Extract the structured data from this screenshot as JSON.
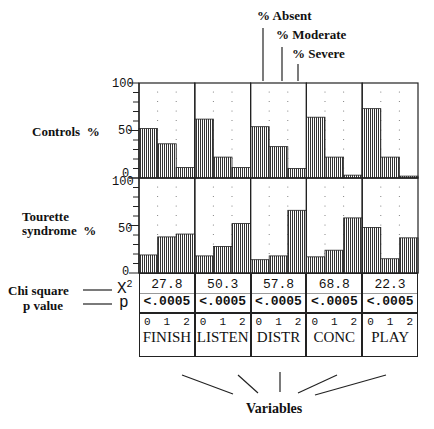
{
  "legend": {
    "absent": "% Absent",
    "moderate": "% Moderate",
    "severe": "% Severe"
  },
  "row_labels": {
    "controls": "Controls  %",
    "tourette_line1": "Tourette",
    "tourette_line2": "syndrome  %",
    "chi_square": "Chi square",
    "p_value": "p value",
    "x2_symbol": "X",
    "x2_sup": "2",
    "p_symbol": "p"
  },
  "axis": {
    "ticks_top": [
      "100",
      "50",
      "0"
    ],
    "ticks_bottom": [
      "100",
      "50",
      "0"
    ]
  },
  "footer": {
    "variables_label": "Variables"
  },
  "chart_data": {
    "type": "bar",
    "title": "",
    "xlabel": "Variables",
    "ylabel": "%",
    "ylim": [
      0,
      100
    ],
    "categories": [
      "FINISH",
      "LISTEN",
      "DISTR",
      "CONC",
      "PLAY"
    ],
    "levels": [
      "0",
      "1",
      "2"
    ],
    "level_meaning": [
      "% Absent",
      "% Moderate",
      "% Severe"
    ],
    "panels": [
      {
        "name": "Controls",
        "series": [
          {
            "name": "FINISH",
            "values": [
              52,
              36,
              11
            ]
          },
          {
            "name": "LISTEN",
            "values": [
              62,
              22,
              11
            ]
          },
          {
            "name": "DISTR",
            "values": [
              54,
              33,
              10
            ]
          },
          {
            "name": "CONC",
            "values": [
              64,
              22,
              3
            ]
          },
          {
            "name": "PLAY",
            "values": [
              73,
              22,
              2
            ]
          }
        ]
      },
      {
        "name": "Tourette syndrome",
        "series": [
          {
            "name": "FINISH",
            "values": [
              19,
              38,
              41
            ]
          },
          {
            "name": "LISTEN",
            "values": [
              18,
              28,
              52
            ]
          },
          {
            "name": "DISTR",
            "values": [
              14,
              18,
              66
            ]
          },
          {
            "name": "CONC",
            "values": [
              17,
              24,
              58
            ]
          },
          {
            "name": "PLAY",
            "values": [
              48,
              15,
              37
            ]
          }
        ]
      }
    ],
    "chi_square": [
      "27.8",
      "50.3",
      "57.8",
      "68.8",
      "22.3"
    ],
    "p_values": [
      "<.0005",
      "<.0005",
      "<.0005",
      "<.0005",
      "<.0005"
    ]
  }
}
